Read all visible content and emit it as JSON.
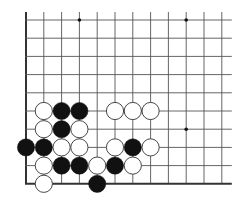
{
  "board": {
    "type": "go-board-fragment",
    "columns": 12,
    "rows": 10,
    "origin_x": 26,
    "origin_y": 20,
    "col_spacing": 17.8,
    "row_spacing": 18.2,
    "edges": {
      "left": true,
      "bottom": true,
      "top": false,
      "right": false
    },
    "line_color": "#555555",
    "edge_color": "#333333",
    "star_points": [
      {
        "col": 3,
        "row": 0
      },
      {
        "col": 9,
        "row": 0
      },
      {
        "col": 9,
        "row": 6
      }
    ],
    "stone_radius": 8.6,
    "colors": {
      "black": "#111111",
      "white": "#ffffff",
      "white_stroke": "#333333"
    },
    "stones": [
      {
        "color": "white",
        "col": 1,
        "row": 5
      },
      {
        "color": "black",
        "col": 2,
        "row": 5
      },
      {
        "color": "black",
        "col": 3,
        "row": 5
      },
      {
        "color": "white",
        "col": 5,
        "row": 5
      },
      {
        "color": "white",
        "col": 6,
        "row": 5
      },
      {
        "color": "white",
        "col": 7,
        "row": 5
      },
      {
        "color": "white",
        "col": 1,
        "row": 6
      },
      {
        "color": "black",
        "col": 2,
        "row": 6
      },
      {
        "color": "white",
        "col": 3,
        "row": 6
      },
      {
        "color": "black",
        "col": 0,
        "row": 7
      },
      {
        "color": "black",
        "col": 1,
        "row": 7
      },
      {
        "color": "white",
        "col": 2,
        "row": 7
      },
      {
        "color": "white",
        "col": 3,
        "row": 7
      },
      {
        "color": "white",
        "col": 5,
        "row": 7
      },
      {
        "color": "black",
        "col": 6,
        "row": 7
      },
      {
        "color": "white",
        "col": 7,
        "row": 7
      },
      {
        "color": "white",
        "col": 1,
        "row": 8
      },
      {
        "color": "black",
        "col": 2,
        "row": 8
      },
      {
        "color": "black",
        "col": 3,
        "row": 8
      },
      {
        "color": "white",
        "col": 4,
        "row": 8
      },
      {
        "color": "black",
        "col": 5,
        "row": 8
      },
      {
        "color": "white",
        "col": 6,
        "row": 8
      },
      {
        "color": "white",
        "col": 1,
        "row": 9
      },
      {
        "color": "black",
        "col": 4,
        "row": 9
      }
    ]
  }
}
